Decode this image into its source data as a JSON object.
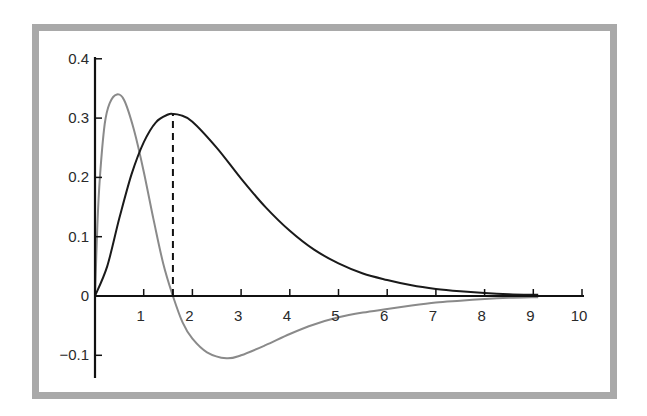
{
  "chart_data": {
    "type": "line",
    "title": "",
    "xlabel": "",
    "ylabel": "",
    "xlim": [
      0,
      10
    ],
    "ylim": [
      -0.13,
      0.4
    ],
    "grid": false,
    "legend": null,
    "x_ticks": [
      "1",
      "2",
      "3",
      "4",
      "5",
      "6",
      "7",
      "8",
      "9",
      "10"
    ],
    "y_ticks": [
      "0.4",
      "0.3",
      "0.2",
      "0.1",
      "0",
      "−0.1"
    ],
    "y_tick_values": [
      0.4,
      0.3,
      0.2,
      0.1,
      0,
      -0.1
    ],
    "series": [
      {
        "name": "density (black curve)",
        "color": "#1a1a1a",
        "x": [
          0,
          0.25,
          0.5,
          0.75,
          1.0,
          1.25,
          1.5,
          1.6,
          1.75,
          2.0,
          2.5,
          3.0,
          3.5,
          4.0,
          4.5,
          5.0,
          5.5,
          6.0,
          6.5,
          7.0,
          7.5,
          8.0,
          8.5,
          9.0,
          9.1
        ],
        "y": [
          0,
          0.05,
          0.131,
          0.205,
          0.259,
          0.293,
          0.306,
          0.307,
          0.305,
          0.294,
          0.25,
          0.198,
          0.15,
          0.11,
          0.078,
          0.055,
          0.038,
          0.027,
          0.018,
          0.012,
          0.008,
          0.005,
          0.003,
          0.002,
          0.002
        ]
      },
      {
        "name": "derivative (gray curve)",
        "color": "#8a8a8a",
        "x": [
          0,
          0.05,
          0.1,
          0.2,
          0.3,
          0.45,
          0.6,
          0.8,
          1.0,
          1.2,
          1.4,
          1.6,
          1.8,
          2.0,
          2.3,
          2.7,
          3.0,
          3.5,
          4.0,
          4.5,
          5.0,
          5.5,
          6.0,
          6.5,
          7.0,
          7.5,
          8.0,
          8.5,
          9.0,
          9.1
        ],
        "y": [
          0,
          0.12,
          0.2,
          0.29,
          0.325,
          0.34,
          0.33,
          0.28,
          0.21,
          0.13,
          0.055,
          0,
          -0.045,
          -0.072,
          -0.095,
          -0.105,
          -0.1,
          -0.083,
          -0.064,
          -0.048,
          -0.036,
          -0.028,
          -0.022,
          -0.016,
          -0.011,
          -0.008,
          -0.005,
          -0.003,
          -0.002,
          -0.002
        ]
      }
    ],
    "annotations": [
      {
        "type": "dashed-vertical-line",
        "x": 1.6,
        "from_y": 0,
        "to_y": 0.307,
        "label": "mode of density"
      }
    ]
  }
}
